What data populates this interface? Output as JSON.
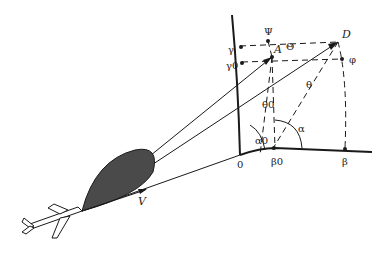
{
  "diagram": {
    "type": "antenna-beam geometry",
    "labels": {
      "psi": "Ψ",
      "A": "A",
      "Theta": "Θ",
      "D": "D",
      "gamma": "γ",
      "gamma0": "γ0",
      "phi": "φ",
      "theta0": "θ0",
      "theta": "θ",
      "alpha": "α",
      "alpha0": "α0",
      "origin": "0",
      "beta0": "β0",
      "beta": "β",
      "V": "V"
    },
    "colors": {
      "ink": "#1a1a1a",
      "beam_fill": "#4a4a4a"
    }
  }
}
